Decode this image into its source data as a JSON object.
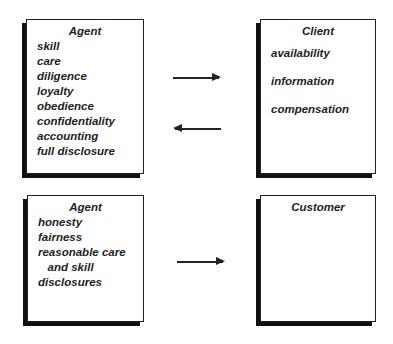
{
  "boxes": {
    "agent_client": {
      "title": "Agent",
      "items": [
        "skill",
        "care",
        "diligence",
        "loyalty",
        "obedience",
        "confidentiality",
        "accounting",
        "full disclosure"
      ]
    },
    "client": {
      "title": "Client",
      "items": [
        "availability",
        "information",
        "compensation"
      ]
    },
    "agent_customer": {
      "title": "Agent",
      "items": [
        "honesty",
        "fairness",
        "reasonable care",
        "   and skill",
        "disclosures"
      ]
    },
    "customer": {
      "title": "Customer",
      "items": []
    }
  },
  "arrows": [
    {
      "from": "agent_client",
      "to": "client",
      "direction": "right"
    },
    {
      "from": "client",
      "to": "agent_client",
      "direction": "left"
    },
    {
      "from": "agent_customer",
      "to": "customer",
      "direction": "right"
    }
  ]
}
